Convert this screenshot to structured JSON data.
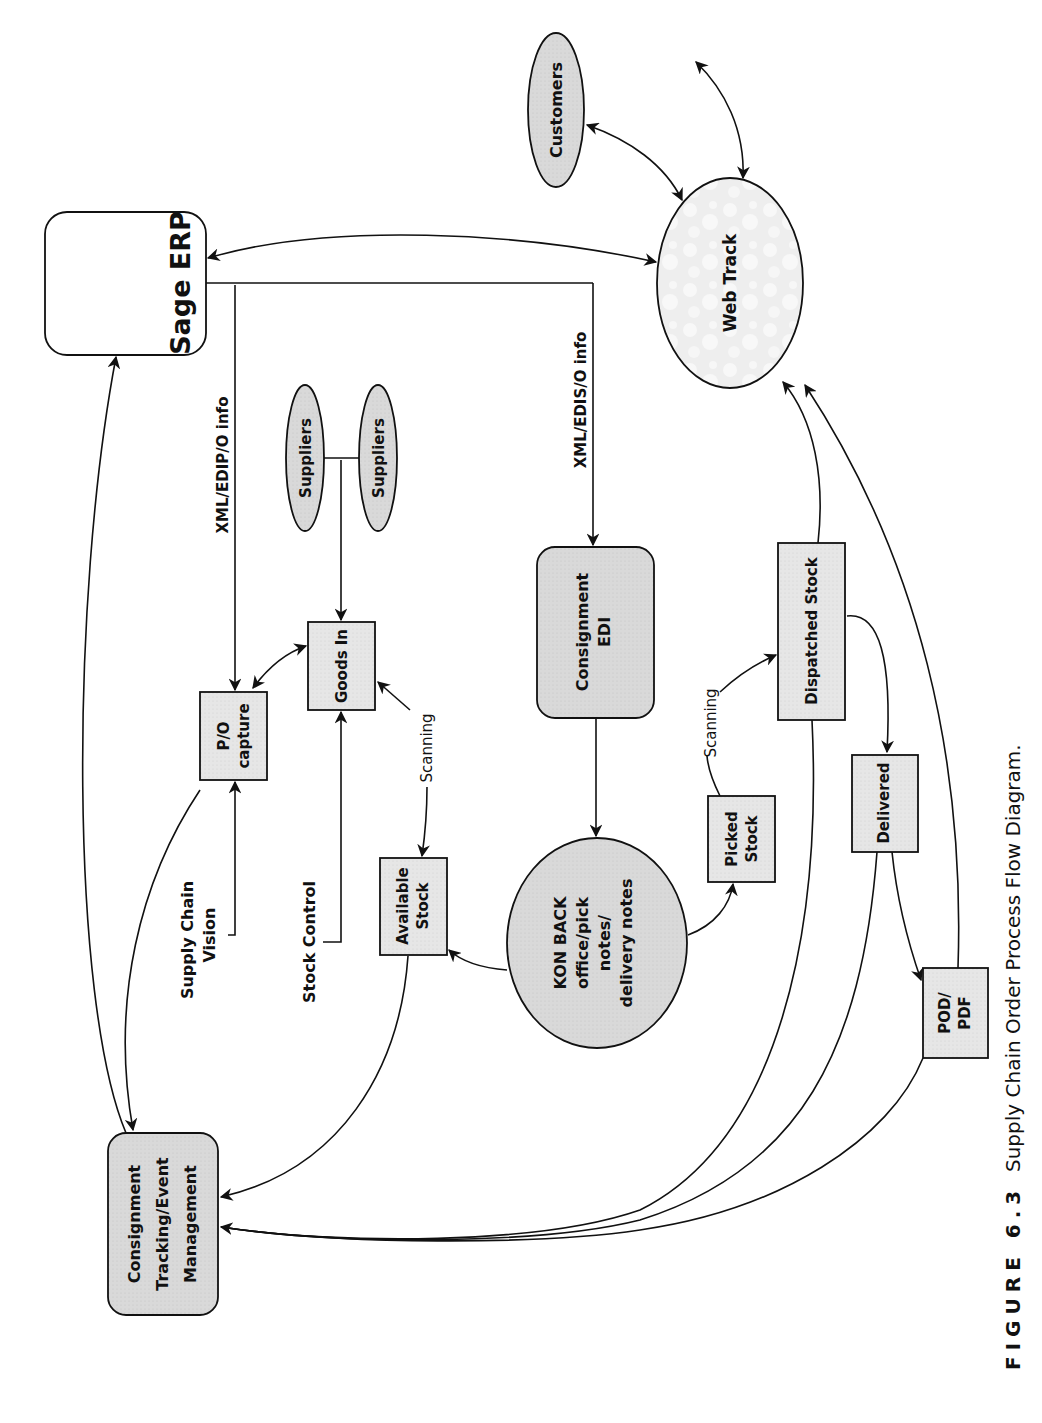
{
  "diagram": {
    "orientation": "rotated-90-ccw",
    "colors": {
      "stroke": "#111111",
      "fill_gray": "#d9d9d9",
      "fill_light": "#e8e8e8",
      "fill_white": "#ffffff",
      "web_track_fill": "#efefef"
    },
    "nodes": {
      "sage_erp": {
        "label": "Sage ERP",
        "shape": "rounded-rect"
      },
      "web_track": {
        "label": "Web Track",
        "shape": "ellipse"
      },
      "customers": {
        "label": "Customers",
        "shape": "ellipse"
      },
      "po_capture": {
        "line1": "P/O",
        "line2": "capture",
        "shape": "rect"
      },
      "goods_in": {
        "label": "Goods In",
        "shape": "rect"
      },
      "suppliers_1": {
        "label": "Suppliers",
        "shape": "ellipse"
      },
      "suppliers_2": {
        "label": "Suppliers",
        "shape": "ellipse"
      },
      "consignment_edi": {
        "line1": "Consignment",
        "line2": "EDI",
        "shape": "rounded-rect"
      },
      "available_stock": {
        "line1": "Available",
        "line2": "Stock",
        "shape": "rect"
      },
      "kon_back": {
        "line1": "KON BACK",
        "line2": "office/pick",
        "line3": "notes/",
        "line4": "delivery notes",
        "shape": "ellipse"
      },
      "picked_stock": {
        "line1": "Picked",
        "line2": "Stock",
        "shape": "rect"
      },
      "dispatched_stock": {
        "label": "Dispatched Stock",
        "shape": "rect"
      },
      "delivered": {
        "label": "Delivered",
        "shape": "rect"
      },
      "pod_pdf": {
        "line1": "POD/",
        "line2": "PDF",
        "shape": "rect"
      },
      "consignment_tracking": {
        "line1": "Consignment",
        "line2": "Tracking/Event",
        "line3": "Management",
        "shape": "rounded-rect"
      },
      "supply_chain_vision": {
        "line1": "Supply Chain",
        "line2": "Vision",
        "shape": "text"
      },
      "stock_control": {
        "label": "Stock Control",
        "shape": "text"
      }
    },
    "edge_labels": {
      "xml_edip": "XML/EDIP/O info",
      "xml_edis": "XML/EDIS/O info",
      "scanning_1": "Scanning",
      "scanning_2": "Scanning"
    },
    "edges": [
      {
        "from": "Web Track",
        "to": "Sage ERP",
        "type": "bidirectional"
      },
      {
        "from": "Sage ERP",
        "to": "P/O capture",
        "label": "XML/EDIP/O info"
      },
      {
        "from": "Sage ERP",
        "to": "Consignment EDI",
        "label": "XML/EDIS/O info"
      },
      {
        "from": "Customers",
        "to": "Web Track",
        "type": "bidirectional"
      },
      {
        "from": "Web Track",
        "to": "(external)",
        "type": "bidirectional"
      },
      {
        "from": "Suppliers",
        "to": "Goods In"
      },
      {
        "from": "P/O capture",
        "to": "Goods In",
        "type": "bidirectional"
      },
      {
        "from": "Supply Chain Vision",
        "to": "P/O capture"
      },
      {
        "from": "Stock Control",
        "to": "Goods In"
      },
      {
        "from": "Goods In",
        "to": "Available Stock",
        "label": "Scanning",
        "type": "bidirectional"
      },
      {
        "from": "Consignment EDI",
        "to": "KON BACK office/pick notes/delivery notes"
      },
      {
        "from": "KON BACK office/pick notes/delivery notes",
        "to": "Available Stock"
      },
      {
        "from": "KON BACK office/pick notes/delivery notes",
        "to": "Picked Stock"
      },
      {
        "from": "Picked Stock",
        "to": "Dispatched Stock",
        "label": "Scanning"
      },
      {
        "from": "Dispatched Stock",
        "to": "Web Track"
      },
      {
        "from": "Dispatched Stock",
        "to": "Delivered"
      },
      {
        "from": "Delivered",
        "to": "POD/PDF"
      },
      {
        "from": "POD/PDF",
        "to": "Web Track"
      },
      {
        "from": "P/O capture",
        "to": "Consignment Tracking/Event Management"
      },
      {
        "from": "Consignment Tracking/Event Management",
        "to": "Sage ERP"
      },
      {
        "from": "Available Stock",
        "to": "Consignment Tracking/Event Management"
      },
      {
        "from": "Dispatched Stock",
        "to": "Consignment Tracking/Event Management"
      },
      {
        "from": "Delivered",
        "to": "Consignment Tracking/Event Management"
      },
      {
        "from": "POD/PDF",
        "to": "Consignment Tracking/Event Management"
      }
    ],
    "caption": {
      "figure": "FIGURE 6.3",
      "text": "Supply Chain Order Process Flow Diagram."
    }
  }
}
